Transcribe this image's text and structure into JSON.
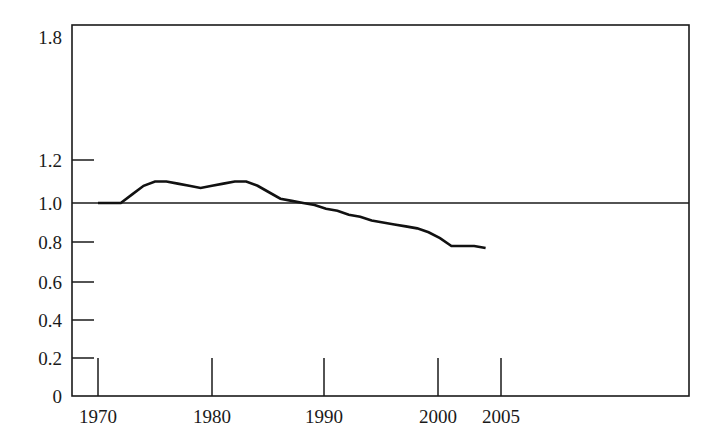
{
  "chart_data": {
    "type": "line",
    "title": "",
    "subtitle": "",
    "xlabel": "",
    "ylabel": "",
    "grid": false,
    "legend": null,
    "xlim": [
      1967.5,
      2009.0
    ],
    "ylim": [
      0,
      1.8
    ],
    "y_axis_note": "Axis is broken above 1.2: the span 1.2 to 1.8 is compressed relative to the even 0.2 steps below it.",
    "x_ticks": [
      1970,
      1980,
      1990,
      2000,
      2005
    ],
    "x_tick_labels": [
      "1970",
      "1980",
      "1990",
      "2000",
      "2005"
    ],
    "y_ticks": [
      0,
      0.2,
      0.4,
      0.6,
      0.8,
      1.0,
      1.2,
      1.8
    ],
    "y_tick_labels": [
      "0",
      "0.2",
      "0.4",
      "0.6",
      "0.8",
      "1.0",
      "1.2",
      "1.8"
    ],
    "reference_line": {
      "value": 1.0,
      "label": "",
      "orientation": "horizontal"
    },
    "series": [
      {
        "name": "index",
        "x": [
          1970,
          1971,
          1972,
          1973,
          1974,
          1975,
          1976,
          1977,
          1978,
          1979,
          1980,
          1981,
          1982,
          1983,
          1984,
          1985,
          1986,
          1987,
          1988,
          1989,
          1990,
          1991,
          1992,
          1993,
          1994,
          1995,
          1996,
          1997,
          1998,
          1999,
          2000,
          2001,
          2002,
          2003,
          2004
        ],
        "values": [
          1.0,
          1.0,
          1.0,
          1.04,
          1.08,
          1.1,
          1.1,
          1.09,
          1.08,
          1.07,
          1.08,
          1.09,
          1.1,
          1.1,
          1.08,
          1.05,
          1.02,
          1.01,
          1.0,
          0.99,
          0.97,
          0.96,
          0.94,
          0.93,
          0.91,
          0.9,
          0.89,
          0.88,
          0.87,
          0.85,
          0.82,
          0.78,
          0.78,
          0.78,
          0.77
        ]
      }
    ]
  },
  "pixel_geometry": {
    "plot_left": 72,
    "plot_right": 689,
    "plot_top": 25,
    "plot_bottom": 396,
    "y_pixel_map": [
      {
        "value": 1.8,
        "y": 25
      },
      {
        "value": 1.2,
        "y": 160
      },
      {
        "value": 1.0,
        "y": 203
      },
      {
        "value": 0.8,
        "y": 242
      },
      {
        "value": 0.6,
        "y": 282
      },
      {
        "value": 0.4,
        "y": 320
      },
      {
        "value": 0.2,
        "y": 358
      },
      {
        "value": 0,
        "y": 396
      }
    ],
    "x_pixel_map": [
      {
        "value": 1970,
        "x": 98
      },
      {
        "value": 1980,
        "x": 212
      },
      {
        "value": 1990,
        "x": 324
      },
      {
        "value": 2000,
        "x": 438
      },
      {
        "value": 2005,
        "x": 501
      }
    ],
    "y_tick_inner_length": 22,
    "x_tick_inner_length": 38,
    "series_pixel_points": "90,203 128,203 140,193 157,181 172,180 196,180 205,183 230,188 243,186 262,183 275,181 295,181 310,190 340,196 360,199 375,203 400,211 430,219 455,226 478,231 500,230 520,239 540,247 600,247 612,253"
  }
}
